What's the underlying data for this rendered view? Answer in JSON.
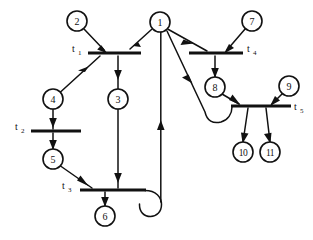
{
  "diagram": {
    "kind": "petri-net",
    "title": "",
    "background_color": "#ffffff",
    "stroke_color": "#111111",
    "places": [
      {
        "id": "p1",
        "label": "1",
        "cx": 160,
        "cy": 22,
        "r": 10
      },
      {
        "id": "p2",
        "label": "2",
        "cx": 77,
        "cy": 21,
        "r": 10
      },
      {
        "id": "p3",
        "label": "3",
        "cx": 118,
        "cy": 99,
        "r": 10
      },
      {
        "id": "p4",
        "label": "4",
        "cx": 53,
        "cy": 99,
        "r": 10
      },
      {
        "id": "p5",
        "label": "5",
        "cx": 53,
        "cy": 159,
        "r": 10
      },
      {
        "id": "p6",
        "label": "6",
        "cx": 105,
        "cy": 216,
        "r": 10
      },
      {
        "id": "p7",
        "label": "7",
        "cx": 252,
        "cy": 21,
        "r": 10
      },
      {
        "id": "p8",
        "label": "8",
        "cx": 215,
        "cy": 87,
        "r": 10
      },
      {
        "id": "p9",
        "label": "9",
        "cx": 289,
        "cy": 86,
        "r": 10
      },
      {
        "id": "p10",
        "label": "10",
        "cx": 243,
        "cy": 152,
        "r": 10
      },
      {
        "id": "p11",
        "label": "11",
        "cx": 270,
        "cy": 152,
        "r": 10
      }
    ],
    "transitions": [
      {
        "id": "t1",
        "label": "t",
        "sub": "1",
        "x1": 88,
        "x2": 141,
        "y": 53,
        "label_x": 72,
        "label_y": 52,
        "label_side": "left"
      },
      {
        "id": "t2",
        "label": "t",
        "sub": "2",
        "x1": 31,
        "x2": 81,
        "y": 131,
        "label_x": 15,
        "label_y": 130,
        "label_side": "left"
      },
      {
        "id": "t3",
        "label": "t",
        "sub": "3",
        "x1": 80,
        "x2": 146,
        "y": 190,
        "label_x": 62,
        "label_y": 189,
        "label_side": "left"
      },
      {
        "id": "t4",
        "label": "t",
        "sub": "4",
        "x1": 189,
        "x2": 243,
        "y": 53,
        "label_x": 247,
        "label_y": 52,
        "label_side": "right"
      },
      {
        "id": "t5",
        "label": "t",
        "sub": "5",
        "x1": 231,
        "x2": 291,
        "y": 106,
        "label_x": 294,
        "label_y": 110,
        "label_side": "right"
      }
    ],
    "arcs": [
      {
        "id": "a1",
        "from": "p2",
        "to": "t1",
        "shape": "line"
      },
      {
        "id": "a2",
        "from": "p1",
        "to": "t1",
        "shape": "line"
      },
      {
        "id": "a3",
        "from": "t1",
        "to": "p4",
        "shape": "line"
      },
      {
        "id": "a4",
        "from": "t1",
        "to": "p3",
        "shape": "line"
      },
      {
        "id": "a5",
        "from": "p4",
        "to": "t2",
        "shape": "line"
      },
      {
        "id": "a6",
        "from": "t2",
        "to": "p5",
        "shape": "line"
      },
      {
        "id": "a7",
        "from": "p5",
        "to": "t3",
        "shape": "line"
      },
      {
        "id": "a8",
        "from": "p3",
        "to": "t3",
        "shape": "line"
      },
      {
        "id": "a9",
        "from": "t3",
        "to": "p6",
        "shape": "line"
      },
      {
        "id": "a10",
        "from": "t3",
        "to": "p1",
        "shape": "curve-loop"
      },
      {
        "id": "a11",
        "from": "p1",
        "to": "t4",
        "shape": "line"
      },
      {
        "id": "a12",
        "from": "p7",
        "to": "t4",
        "shape": "line"
      },
      {
        "id": "a13",
        "from": "t4",
        "to": "p8",
        "shape": "line"
      },
      {
        "id": "a14",
        "from": "p8",
        "to": "t5",
        "shape": "line"
      },
      {
        "id": "a15",
        "from": "p9",
        "to": "t5",
        "shape": "line"
      },
      {
        "id": "a16",
        "from": "t5",
        "to": "p10",
        "shape": "line"
      },
      {
        "id": "a17",
        "from": "t5",
        "to": "p11",
        "shape": "line"
      },
      {
        "id": "a18",
        "from": "p1",
        "to": "t5",
        "shape": "curve-right"
      }
    ]
  }
}
